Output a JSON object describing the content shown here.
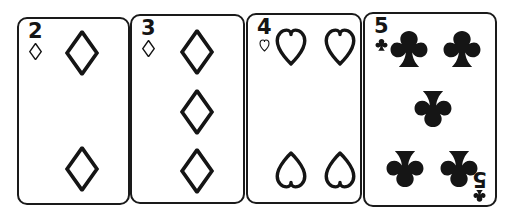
{
  "scene": {
    "description": "Four overlapping playing cards illustration, black line art on white",
    "background_color": "#ffffff",
    "ink_color": "#151515"
  },
  "cards": [
    {
      "id": "card-two-of-diamonds",
      "rank": "2",
      "suit": "diamonds",
      "suit_symbol": "♦",
      "suit_icon": "diamond-icon",
      "fill": "outline",
      "color": "#151515",
      "x": 17,
      "y": 17,
      "width": 113,
      "height": 188,
      "pip_count": 2,
      "pips": [
        {
          "cx": 63,
          "cy": 34,
          "flip": false
        },
        {
          "cx": 63,
          "cy": 150,
          "flip": false
        }
      ]
    },
    {
      "id": "card-three-of-diamonds",
      "rank": "3",
      "suit": "diamonds",
      "suit_symbol": "♦",
      "suit_icon": "diamond-icon",
      "fill": "outline",
      "color": "#151515",
      "x": 130,
      "y": 14,
      "width": 115,
      "height": 190,
      "pip_count": 3,
      "pips": [
        {
          "cx": 65,
          "cy": 36,
          "flip": false
        },
        {
          "cx": 65,
          "cy": 96,
          "flip": false
        },
        {
          "cx": 65,
          "cy": 155,
          "flip": false
        }
      ]
    },
    {
      "id": "card-four-of-hearts",
      "rank": "4",
      "suit": "hearts",
      "suit_symbol": "♥",
      "suit_icon": "heart-icon",
      "fill": "outline",
      "color": "#151515",
      "x": 246,
      "y": 13,
      "width": 116,
      "height": 191,
      "pip_count": 4,
      "pips": [
        {
          "cx": 43,
          "cy": 32,
          "flip": false
        },
        {
          "cx": 92,
          "cy": 32,
          "flip": false
        },
        {
          "cx": 43,
          "cy": 155,
          "flip": true
        },
        {
          "cx": 92,
          "cy": 155,
          "flip": true
        }
      ]
    },
    {
      "id": "card-five-of-clubs",
      "rank": "5",
      "suit": "clubs",
      "suit_symbol": "♣",
      "suit_icon": "club-icon",
      "fill": "solid",
      "color": "#151515",
      "x": 363,
      "y": 12,
      "width": 134,
      "height": 195,
      "pip_count": 5,
      "has_bottom_right_index": true,
      "pips": [
        {
          "cx": 44,
          "cy": 35,
          "flip": false
        },
        {
          "cx": 97,
          "cy": 35,
          "flip": false
        },
        {
          "cx": 68,
          "cy": 95,
          "flip": true
        },
        {
          "cx": 40,
          "cy": 155,
          "flip": true
        },
        {
          "cx": 94,
          "cy": 155,
          "flip": true
        }
      ]
    }
  ]
}
